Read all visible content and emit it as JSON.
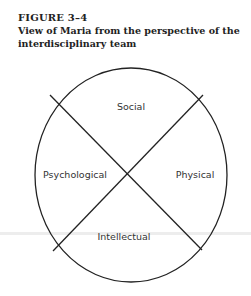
{
  "figure": {
    "number": "FIGURE  3–4",
    "caption": "View of Maria from the perspective of the interdisciplinary team"
  },
  "diagram": {
    "type": "circle-quadrants",
    "segments": [
      {
        "position": "top",
        "label": "Social"
      },
      {
        "position": "left",
        "label": "Psychological"
      },
      {
        "position": "right",
        "label": "Physical"
      },
      {
        "position": "bottom",
        "label": "Intellectual"
      }
    ]
  }
}
